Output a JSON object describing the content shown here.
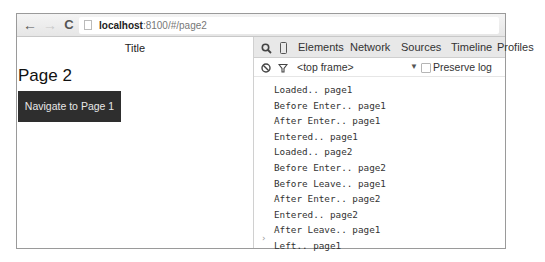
{
  "browser": {
    "back_icon": "←",
    "forward_icon": "→",
    "reload_icon": "C",
    "url_host": "localhost",
    "url_rest": ":8100/#/page2"
  },
  "page": {
    "title": "Title",
    "heading": "Page 2",
    "navigate_button": "Navigate to Page 1"
  },
  "devtools": {
    "search_icon": "🔍",
    "device_icon": "▯",
    "tabs": [
      {
        "label": "Elements"
      },
      {
        "label": "Network"
      },
      {
        "label": "Sources"
      },
      {
        "label": "Timeline"
      },
      {
        "label": "Profiles"
      }
    ],
    "console_bar": {
      "clear_icon": "⃠",
      "filter_icon": "▽",
      "frame": "<top frame>",
      "frame_arrow": "▼",
      "preserve_log_label": "Preserve log",
      "preserve_log_checked": false
    },
    "log": [
      "Loaded.. page1",
      "Before Enter.. page1",
      "After Enter.. page1",
      "Entered.. page1",
      "Loaded.. page2",
      "Before Enter.. page2",
      "Before Leave.. page1",
      "After Enter.. page2",
      "Entered.. page2",
      "After Leave.. page1",
      "Left.. page1"
    ],
    "prompt": "›"
  }
}
